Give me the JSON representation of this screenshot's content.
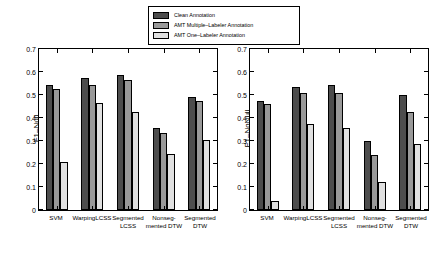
{
  "legend": {
    "items": [
      {
        "label": "Clean Annotation",
        "color": "#4d4d4d"
      },
      {
        "label": "AMT Multiple–Labeler Annotation",
        "color": "#999999"
      },
      {
        "label": "AMT One–Labeler Annotation",
        "color": "#e0e0e0"
      }
    ]
  },
  "chart_data": [
    {
      "type": "bar",
      "title": "",
      "xlabel": "",
      "ylabel": "F1–Null",
      "ylim": [
        0,
        0.7
      ],
      "yticks": [
        "0",
        "0.1",
        "0.2",
        "0.3",
        "0.4",
        "0.5",
        "0.6",
        "0.7"
      ],
      "grid": false,
      "legend_position": "top-center",
      "categories": [
        "SVM",
        "WarpingLCSS",
        "Segmented\nLCSS",
        "Nonseg-\nmented DTW",
        "Segmented\nDTW"
      ],
      "series": [
        {
          "name": "Clean Annotation",
          "color": "#4d4d4d",
          "values": [
            0.545,
            0.575,
            0.585,
            0.355,
            0.49
          ]
        },
        {
          "name": "AMT Multiple–Labeler Annotation",
          "color": "#999999",
          "values": [
            0.525,
            0.545,
            0.565,
            0.335,
            0.475
          ]
        },
        {
          "name": "AMT One–Labeler Annotation",
          "color": "#e0e0e0",
          "values": [
            0.21,
            0.465,
            0.425,
            0.245,
            0.305
          ]
        }
      ]
    },
    {
      "type": "bar",
      "title": "",
      "xlabel": "",
      "ylabel": "F1–NoNull",
      "ylim": [
        0,
        0.7
      ],
      "yticks": [
        "0",
        "0.1",
        "0.2",
        "0.3",
        "0.4",
        "0.5",
        "0.6",
        "0.7"
      ],
      "grid": false,
      "legend_position": "top-center",
      "categories": [
        "SVM",
        "WarpingLCSS",
        "Segmented\nLCSS",
        "Nonseg-\nmented DTW",
        "Segmented\nDTW"
      ],
      "series": [
        {
          "name": "Clean Annotation",
          "color": "#4d4d4d",
          "values": [
            0.475,
            0.535,
            0.545,
            0.3,
            0.5
          ]
        },
        {
          "name": "AMT Multiple–Labeler Annotation",
          "color": "#999999",
          "values": [
            0.46,
            0.51,
            0.51,
            0.24,
            0.425
          ]
        },
        {
          "name": "AMT One–Labeler Annotation",
          "color": "#e0e0e0",
          "values": [
            0.04,
            0.375,
            0.355,
            0.12,
            0.285
          ]
        }
      ]
    }
  ]
}
